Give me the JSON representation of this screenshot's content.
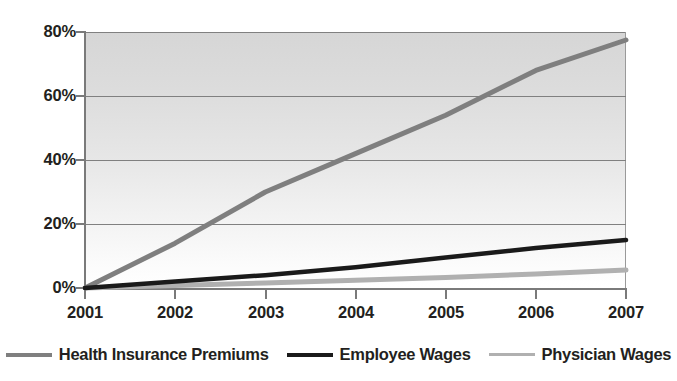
{
  "chart_data": {
    "type": "line",
    "title": "",
    "xlabel": "",
    "ylabel": "",
    "x": [
      "2001",
      "2002",
      "2003",
      "2004",
      "2005",
      "2006",
      "2007"
    ],
    "categories": [
      "2001",
      "2002",
      "2003",
      "2004",
      "2005",
      "2006",
      "2007"
    ],
    "series": [
      {
        "name": "Health Insurance Premiums",
        "color": "#7f7f7f",
        "values": [
          0,
          14,
          30,
          42,
          54,
          68,
          77.5
        ]
      },
      {
        "name": "Employee Wages",
        "color": "#1a1a1a",
        "values": [
          0,
          2,
          4,
          6.5,
          9.5,
          12.5,
          15
        ]
      },
      {
        "name": "Physician Wages",
        "color": "#b0b0b0",
        "values": [
          0,
          0.8,
          1.6,
          2.4,
          3.3,
          4.4,
          5.6
        ]
      }
    ],
    "ylim": [
      0,
      80
    ],
    "ytick_values": [
      0,
      20,
      40,
      60,
      80
    ],
    "ytick_labels": [
      "0%",
      "20%",
      "40%",
      "60%",
      "80%"
    ],
    "xtick_labels": [
      "2001",
      "2002",
      "2003",
      "2004",
      "2005",
      "2006",
      "2007"
    ],
    "grid": true,
    "grid_axis": "y",
    "legend_position": "bottom",
    "plot_background": "gradient-gray-to-white"
  },
  "axes": {
    "y_ticks": [
      {
        "label": "80%",
        "value": 80
      },
      {
        "label": "60%",
        "value": 60
      },
      {
        "label": "40%",
        "value": 40
      },
      {
        "label": "20%",
        "value": 20
      },
      {
        "label": "0%",
        "value": 0
      }
    ],
    "x_ticks": [
      {
        "label": "2001"
      },
      {
        "label": "2002"
      },
      {
        "label": "2003"
      },
      {
        "label": "2004"
      },
      {
        "label": "2005"
      },
      {
        "label": "2006"
      },
      {
        "label": "2007"
      }
    ]
  },
  "legend": {
    "items": [
      {
        "label": "Health Insurance Premiums",
        "color": "#7f7f7f"
      },
      {
        "label": "Employee Wages",
        "color": "#1a1a1a"
      },
      {
        "label": "Physician Wages",
        "color": "#b0b0b0"
      }
    ]
  },
  "colors": {
    "health_insurance": "#7f7f7f",
    "employee_wages": "#1a1a1a",
    "physician_wages": "#b0b0b0",
    "gridline": "#808080",
    "axis": "#7a7a7a",
    "text": "#231f20"
  }
}
